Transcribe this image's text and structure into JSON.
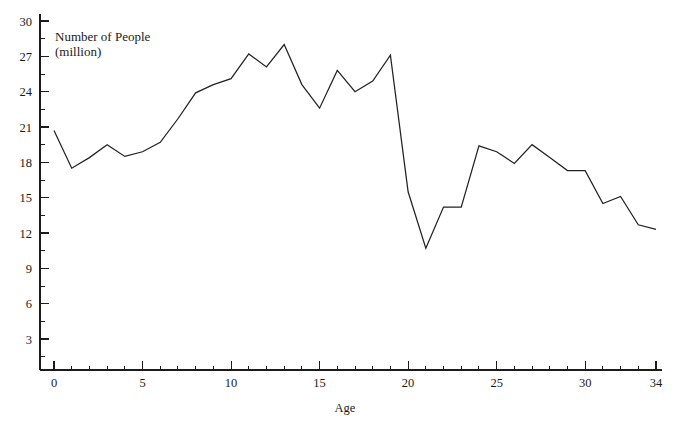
{
  "chart_data": {
    "type": "line",
    "title": "",
    "series_caption_line1": "Number of People",
    "series_caption_line2": "(million)",
    "xlabel": "Age",
    "ylabel": "Number of People (million)",
    "xlim": [
      0,
      34
    ],
    "ylim": [
      0,
      31
    ],
    "grid": false,
    "legend": "none",
    "x_ticks": [
      0,
      5,
      10,
      15,
      20,
      25,
      30,
      34
    ],
    "x_tick_labels": [
      "0",
      "5",
      "10",
      "15",
      "20",
      "25",
      "30",
      "34"
    ],
    "x_minor_step": 1,
    "y_ticks": [
      3,
      6,
      9,
      12,
      15,
      18,
      21,
      24,
      27,
      30
    ],
    "y_tick_labels": [
      "3",
      "6",
      "9",
      "12",
      "15",
      "18",
      "21",
      "24",
      "27",
      "30"
    ],
    "y_minor_ticks": [
      1.5,
      4.5,
      7.5,
      10.5,
      13.5,
      16.5,
      19.5,
      22.5,
      25.5,
      28.5
    ],
    "line_color": "#222222",
    "axis_color": "#1c1c1c",
    "background_color": "#ffffff",
    "x": [
      0,
      1,
      2,
      3,
      4,
      5,
      6,
      7,
      8,
      9,
      10,
      11,
      12,
      13,
      14,
      15,
      16,
      17,
      18,
      19,
      20,
      21,
      22,
      23,
      24,
      25,
      26,
      27,
      28,
      29,
      30,
      31,
      32,
      33,
      34
    ],
    "values": [
      20.7,
      17.5,
      18.4,
      19.5,
      18.5,
      18.9,
      19.7,
      21.7,
      23.9,
      24.6,
      25.1,
      27.2,
      26.1,
      28.0,
      24.6,
      22.6,
      25.8,
      24.0,
      24.9,
      27.1,
      15.5,
      10.7,
      14.2,
      14.2,
      19.4,
      18.9,
      17.9,
      19.5,
      18.4,
      17.3,
      17.3,
      14.5,
      15.1,
      12.7,
      12.3
    ],
    "categories": [
      "0",
      "1",
      "2",
      "3",
      "4",
      "5",
      "6",
      "7",
      "8",
      "9",
      "10",
      "11",
      "12",
      "13",
      "14",
      "15",
      "16",
      "17",
      "18",
      "19",
      "20",
      "21",
      "22",
      "23",
      "24",
      "25",
      "26",
      "27",
      "28",
      "29",
      "30",
      "31",
      "32",
      "33",
      "34"
    ]
  },
  "figure": {
    "caption_line1": "Number of People",
    "caption_line2": "(million)",
    "x_axis_title": "Age"
  }
}
